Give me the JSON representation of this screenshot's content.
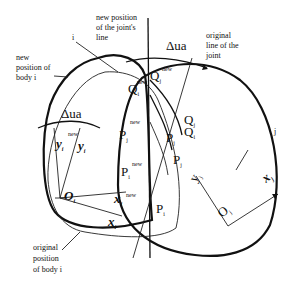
{
  "diagram": {
    "annotations": {
      "new_joint_line": [
        "new position",
        "of the joint's",
        "line"
      ],
      "original_joint_line": [
        "original",
        "line of the",
        "joint"
      ],
      "new_body_i": [
        "new",
        "position of",
        "body i"
      ],
      "original_body_i": [
        "original",
        "position",
        "of body i"
      ],
      "body_i_label": "i",
      "body_j_label": "j"
    },
    "symbols": {
      "delta_ua_left": "Δua",
      "delta_ua_right": "Δua",
      "Qj_new": "Q",
      "Qj_new_sub": "j",
      "Qi_new": "Q",
      "Qi_new_sub": "i",
      "Qj": "Q",
      "Qj_sub": "j",
      "Qi": "Q",
      "Qi_sub": "i",
      "Pj_new": "P",
      "Pj_new_sub": "j",
      "Pi_new": "P",
      "Pi_new_sub": "i",
      "Pj_a": "P",
      "Pj_a_sub": "j",
      "Pj_b": "P",
      "Pj_b_sub": "j",
      "Pi": "P",
      "Pi_sub": "i",
      "Oi": "O",
      "Oi_sub": "i",
      "Oj": "O",
      "Oj_sub": "j",
      "yi_new": "y",
      "yi_new_sub": "i",
      "yi": "y",
      "yi_sub": "i",
      "xi_new": "x",
      "xi_new_sub": "i",
      "xi": "x",
      "xi_sub": "i",
      "yj": "y",
      "yj_sub": "j",
      "xj": "x",
      "xj_sub": "j",
      "new_sup": "new"
    }
  }
}
